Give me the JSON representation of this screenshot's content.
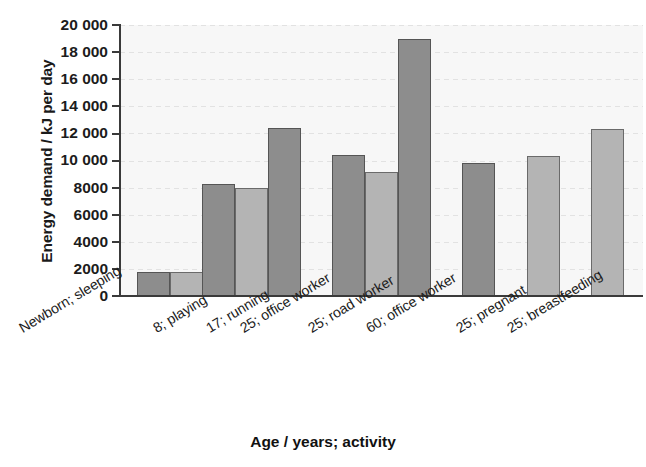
{
  "chart_data": {
    "type": "bar",
    "title": "",
    "xlabel": "Age / years; activity",
    "ylabel": "Energy demand / kJ per day",
    "ylim": [
      0,
      20000
    ],
    "ytick_labels": [
      "20 000",
      "18 000",
      "16 000",
      "14 000",
      "12 000",
      "10 000",
      "8000",
      "6000",
      "4000",
      "2000",
      "0"
    ],
    "ytick_values": [
      20000,
      18000,
      16000,
      14000,
      12000,
      10000,
      8000,
      6000,
      4000,
      2000,
      0
    ],
    "grid": true,
    "legend": "none",
    "categories": [
      "Newborn; sleeping",
      "8; playing",
      "17; running",
      "25; office worker",
      "25; road worker",
      "60; office worker",
      "25; pregnant",
      "25; breastfeeding"
    ],
    "series": [
      {
        "name": "male",
        "color": "#8d8d8d",
        "values": [
          1800,
          8300,
          12400,
          10400,
          19000,
          9800,
          null,
          null
        ]
      },
      {
        "name": "female",
        "color": "#b4b4b4",
        "values": [
          1800,
          8000,
          null,
          9150,
          null,
          null,
          10350,
          12300
        ]
      }
    ],
    "bars": [
      {
        "category": "Newborn; sleeping",
        "series": "male",
        "value": 1800,
        "shade": "dark"
      },
      {
        "category": "Newborn; sleeping",
        "series": "female",
        "value": 1800,
        "shade": "light"
      },
      {
        "category": "8; playing",
        "series": "male",
        "value": 8300,
        "shade": "dark"
      },
      {
        "category": "8; playing",
        "series": "female",
        "value": 8000,
        "shade": "light"
      },
      {
        "category": "17; running",
        "series": "male",
        "value": 12400,
        "shade": "dark"
      },
      {
        "category": "25; office worker",
        "series": "male",
        "value": 10400,
        "shade": "dark"
      },
      {
        "category": "25; office worker",
        "series": "female",
        "value": 9150,
        "shade": "light"
      },
      {
        "category": "25; road worker",
        "series": "male",
        "value": 19000,
        "shade": "dark"
      },
      {
        "category": "60; office worker",
        "series": "male",
        "value": 9800,
        "shade": "dark"
      },
      {
        "category": "25; pregnant",
        "series": "female",
        "value": 10350,
        "shade": "light"
      },
      {
        "category": "25; breastfeeding",
        "series": "female",
        "value": 12300,
        "shade": "light"
      }
    ]
  },
  "axes": {
    "ylabel": "Energy demand / kJ per day",
    "xlabel": "Age / years; activity"
  },
  "yticks": {
    "t0": "20 000",
    "t1": "18 000",
    "t2": "16 000",
    "t3": "14 000",
    "t4": "12 000",
    "t5": "10 000",
    "t6": "8000",
    "t7": "6000",
    "t8": "4000",
    "t9": "2000",
    "t10": "0"
  },
  "categories": {
    "c0": "Newborn; sleeping",
    "c1": "8; playing",
    "c2": "17; running",
    "c3": "25; office worker",
    "c4": "25; road worker",
    "c5": "60; office worker",
    "c6": "25; pregnant",
    "c7": "25; breastfeeding"
  },
  "colors": {
    "bar_dark": "#8d8d8d",
    "bar_light": "#b4b4b4",
    "axis": "#3a3a3a",
    "plot_background": "#f7f7f7",
    "grid": "#e2e2e2"
  }
}
